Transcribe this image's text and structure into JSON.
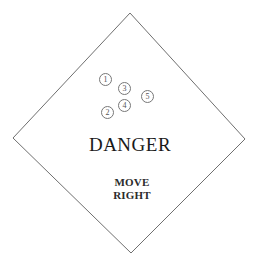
{
  "sign": {
    "shape": "diamond",
    "outline_color": "#6f6f6f",
    "background_color": "#ffffff",
    "vertices": {
      "top": [
        130,
        13
      ],
      "right": [
        245,
        139
      ],
      "bottom": [
        131,
        253
      ],
      "left": [
        13,
        138
      ]
    }
  },
  "title": {
    "text": "DANGER"
  },
  "instructions": {
    "line1": "MOVE",
    "line2": "RIGHT"
  },
  "markers": [
    {
      "id": "1",
      "label": "1",
      "x": 105,
      "y": 79
    },
    {
      "id": "2",
      "label": "2",
      "x": 107,
      "y": 112
    },
    {
      "id": "3",
      "label": "3",
      "x": 124,
      "y": 88
    },
    {
      "id": "4",
      "label": "4",
      "x": 124,
      "y": 105
    },
    {
      "id": "5",
      "label": "5",
      "x": 147,
      "y": 96
    }
  ]
}
